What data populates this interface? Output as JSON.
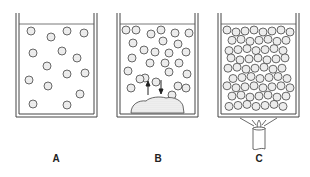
{
  "figure": {
    "panels": [
      {
        "id": "A",
        "label": "A",
        "description": "Dilute solution: few scattered solute particles in liquid",
        "particles": [
          [
            31,
            31
          ],
          [
            51,
            37
          ],
          [
            67,
            31
          ],
          [
            84,
            33
          ],
          [
            33,
            53
          ],
          [
            62,
            51
          ],
          [
            77,
            58
          ],
          [
            47,
            66
          ],
          [
            67,
            74
          ],
          [
            85,
            73
          ],
          [
            29,
            80
          ],
          [
            48,
            86
          ],
          [
            80,
            94
          ],
          [
            33,
            104
          ],
          [
            67,
            105
          ]
        ]
      },
      {
        "id": "B",
        "label": "B",
        "description": "Saturated solution in equilibrium with undissolved solid; arrows show dissolution and crystallization",
        "arrows": [
          "up",
          "down"
        ],
        "particles": [
          [
            126,
            30
          ],
          [
            136,
            30
          ],
          [
            151,
            34
          ],
          [
            161,
            30
          ],
          [
            175,
            33
          ],
          [
            189,
            33
          ],
          [
            133,
            43
          ],
          [
            163,
            41
          ],
          [
            178,
            44
          ],
          [
            144,
            50
          ],
          [
            155,
            52
          ],
          [
            169,
            53
          ],
          [
            186,
            52
          ],
          [
            132,
            58
          ],
          [
            150,
            63
          ],
          [
            165,
            63
          ],
          [
            179,
            63
          ],
          [
            128,
            71
          ],
          [
            145,
            78
          ],
          [
            169,
            72
          ],
          [
            187,
            74
          ],
          [
            140,
            79
          ],
          [
            156,
            82
          ],
          [
            178,
            86
          ],
          [
            131,
            88
          ],
          [
            186,
            88
          ],
          [
            172,
            95
          ]
        ]
      },
      {
        "id": "C",
        "label": "C",
        "description": "Supersaturated solution: densely packed particles, heated from below by a burner"
      }
    ]
  }
}
